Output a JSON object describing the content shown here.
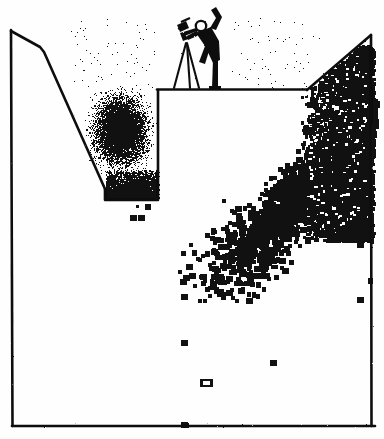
{
  "image": {
    "kind": "scanned-cartoon-scatter-plot",
    "width": 384,
    "height": 439,
    "background_color": "#fefefe",
    "ink_color": "#111111",
    "title": "",
    "caption": ""
  },
  "chart_data": {
    "type": "scatter",
    "title": "",
    "subtitle": "",
    "xlabel": "",
    "ylabel": "",
    "xlim": [
      0,
      100
    ],
    "ylim": [
      0,
      100
    ],
    "grid": false,
    "legend": null,
    "tick_labels": {
      "x": [],
      "y": []
    },
    "annotations": [
      {
        "name": "surveyor-figure",
        "label": "",
        "x": 50,
        "y": 96,
        "description": "stick figure standing on plateau edge with a tripod surveying instrument, one arm raised"
      }
    ],
    "series": [
      {
        "name": "dense-stipple-cloud",
        "marker": "stipple",
        "color": "#111111",
        "description": "dense dithered point cloud filling the left trench slope",
        "x_range": [
          17,
          41
        ],
        "y_range": [
          36,
          80
        ],
        "point_count": 2600
      },
      {
        "name": "square-marker-scatter",
        "marker": "square",
        "color": "#111111",
        "description": "large square markers forming a wedge rising to the upper-right corner",
        "x_range": [
          55,
          100
        ],
        "y_range": [
          12,
          80
        ],
        "point_count": 430
      },
      {
        "name": "outlier-markers",
        "marker": "square",
        "color": "#111111",
        "description": "isolated outlier markers scattered low in the field",
        "points": [
          [
            47,
            22
          ],
          [
            72,
            17
          ],
          [
            53,
            12
          ],
          [
            96,
            33
          ],
          [
            96,
            47
          ],
          [
            47,
            1
          ],
          [
            33,
            54
          ],
          [
            35,
            54
          ]
        ]
      }
    ],
    "frame_outline": {
      "description": "hand-drawn axes forming a trench / valley cross-section profile",
      "vertices": [
        [
          11,
          30
        ],
        [
          40,
          47
        ],
        [
          105,
          190
        ],
        [
          105,
          200
        ],
        [
          158,
          200
        ],
        [
          158,
          89
        ],
        [
          307,
          89
        ],
        [
          371,
          35
        ],
        [
          371,
          426
        ],
        [
          12,
          426
        ],
        [
          11,
          30
        ]
      ]
    }
  },
  "elements": {
    "left_axis": "left-vertical-axis",
    "bottom_axis": "bottom-horizontal-axis",
    "right_axis": "right-vertical-axis",
    "left_slope": "left-diagonal-slope",
    "ledge": "center-plateau-ledge",
    "right_slope": "right-diagonal-slope"
  }
}
